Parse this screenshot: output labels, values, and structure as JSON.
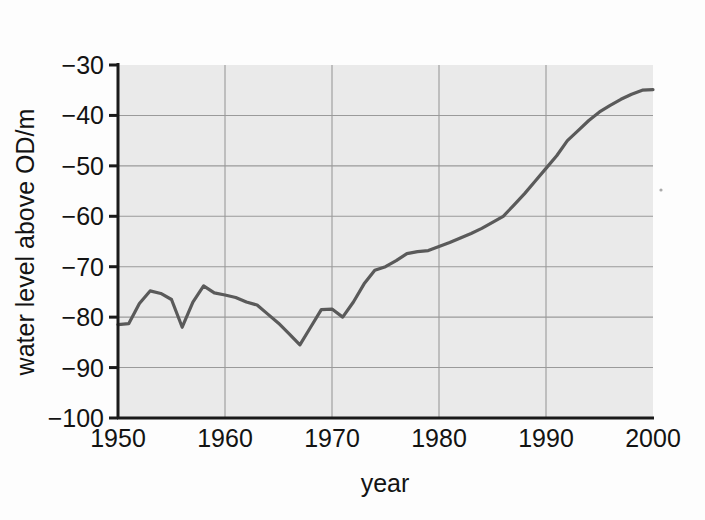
{
  "figure": {
    "background_color": "#fdfdfd",
    "plot_background_color": "#eaeaea",
    "grid_color": "#9a9a9a",
    "axis_color": "#1a1a1a",
    "line_color": "#5a5a5a",
    "artifact_speck": "scan-speck"
  },
  "chart_data": {
    "type": "line",
    "title": "",
    "xlabel": "year",
    "ylabel": "water level above OD/m",
    "xlim": [
      1950,
      2000
    ],
    "ylim": [
      -100,
      -30
    ],
    "grid": true,
    "legend": "none",
    "xticks": [
      1950,
      1960,
      1970,
      1980,
      1990,
      2000
    ],
    "xtick_labels": [
      "1950",
      "1960",
      "1970",
      "1980",
      "1990",
      "2000"
    ],
    "yticks": [
      -30,
      -40,
      -50,
      -60,
      -70,
      -80,
      -90,
      -100
    ],
    "ytick_labels": [
      "−30",
      "−40",
      "−50",
      "−60",
      "−70",
      "−80",
      "−90",
      "−100"
    ],
    "series": [
      {
        "name": "water level",
        "color": "#5a5a5a",
        "x": [
          1950,
          1951,
          1952,
          1953,
          1954,
          1955,
          1956,
          1957,
          1958,
          1959,
          1960,
          1961,
          1962,
          1963,
          1964,
          1965,
          1966,
          1967,
          1968,
          1969,
          1970,
          1971,
          1972,
          1973,
          1974,
          1975,
          1976,
          1977,
          1978,
          1979,
          1980,
          1981,
          1982,
          1983,
          1984,
          1985,
          1986,
          1987,
          1988,
          1989,
          1990,
          1991,
          1992,
          1993,
          1994,
          1995,
          1996,
          1997,
          1998,
          1999,
          2000
        ],
        "y": [
          -81.5,
          -81.3,
          -77.3,
          -74.8,
          -75.3,
          -76.5,
          -82.0,
          -77.0,
          -73.8,
          -75.2,
          -75.6,
          -76.1,
          -77.0,
          -77.6,
          -79.4,
          -81.2,
          -83.3,
          -85.5,
          -82.0,
          -78.5,
          -78.4,
          -80.0,
          -77.0,
          -73.4,
          -70.7,
          -70.0,
          -68.8,
          -67.4,
          -67.0,
          -66.8,
          -66.0,
          -65.2,
          -64.3,
          -63.4,
          -62.4,
          -61.2,
          -60.0,
          -57.8,
          -55.5,
          -53.0,
          -50.5,
          -48.0,
          -45.0,
          -43.0,
          -41.0,
          -39.3,
          -38.0,
          -36.8,
          -35.8,
          -35.0,
          -34.9
        ]
      }
    ]
  }
}
